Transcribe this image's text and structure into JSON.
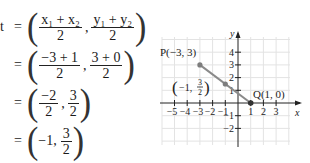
{
  "derivation": {
    "lead_symbol": "t",
    "equals": "=",
    "steps": [
      {
        "x_num": "x₁ + x₂",
        "x_den": "2",
        "y_num": "y₁ + y₂",
        "y_den": "2"
      },
      {
        "x_num": "−3 + 1",
        "x_den": "2",
        "y_num": "3 + 0",
        "y_den": "2"
      },
      {
        "x_num": "−2",
        "x_den": "2",
        "y_num": "3",
        "y_den": "2"
      },
      {
        "x_plain": "−1,",
        "y_num": "3",
        "y_den": "2"
      }
    ]
  },
  "graph": {
    "x_axis_label": "x",
    "y_axis_label": "y",
    "x_ticks": [
      "−5",
      "−4",
      "−3",
      "−2",
      "−1",
      "1",
      "2",
      "3"
    ],
    "y_ticks": [
      "4",
      "3",
      "2",
      "1",
      "−1",
      "−2"
    ],
    "points": [
      {
        "name": "P",
        "label": "P(−3, 3)",
        "x": -3,
        "y": 3
      },
      {
        "name": "M",
        "label_prefix": "−1,",
        "label_num": "3",
        "label_den": "2",
        "x": -1,
        "y": 1.5
      },
      {
        "name": "Q",
        "label": "Q(1, 0)",
        "x": 1,
        "y": 0
      }
    ],
    "colors": {
      "segment": "#8a8a8a",
      "grid": "#e3e3e3",
      "axis": "#222222",
      "point": "#7d7d7d"
    }
  }
}
